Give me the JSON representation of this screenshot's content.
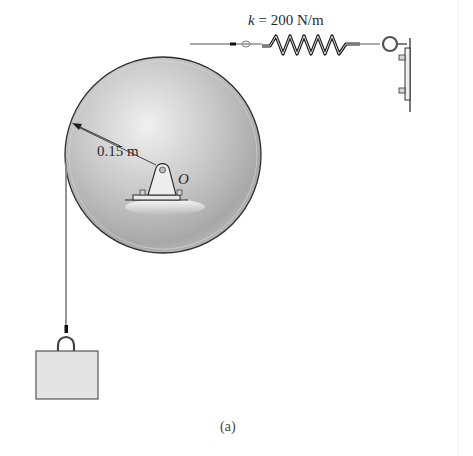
{
  "figure": {
    "caption": "(a)",
    "colors": {
      "disc_fill_light": "#e6e6e6",
      "disc_fill_dark": "#9e9e9e",
      "outline": "#3a3a3a",
      "spring_dark": "#1a1a1a",
      "block_fill": "#e4e4e4",
      "cable": "#8a8a8a"
    }
  },
  "spring": {
    "symbol": "k",
    "equals": " = ",
    "value_text": "200 N/m"
  },
  "disc": {
    "radius_label": "0.15 m",
    "pivot_label": "O"
  }
}
